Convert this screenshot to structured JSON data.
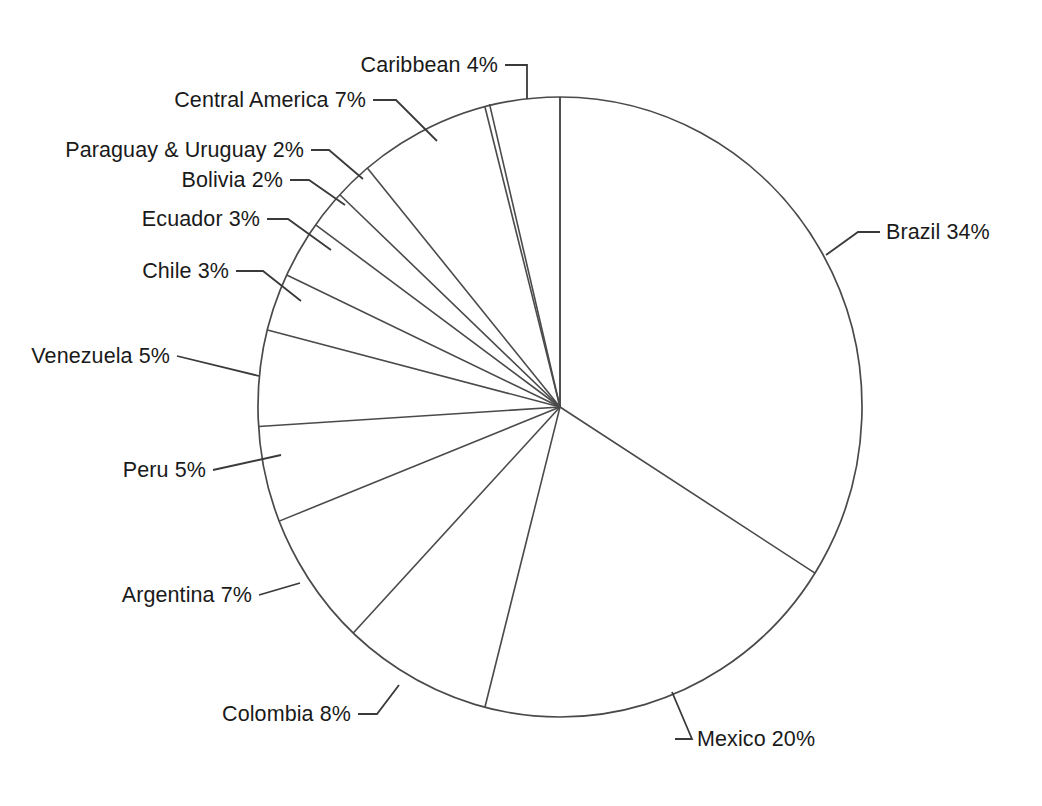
{
  "chart_data": {
    "type": "pie",
    "title": "",
    "subtitle": "",
    "xlabel": "",
    "ylabel": "",
    "legend_position": "none",
    "grid": false,
    "start_angle_deg": 0,
    "direction": "clockwise",
    "units": "percent",
    "total": 100,
    "categories": [
      "Brazil",
      "Mexico",
      "Colombia",
      "Argentina",
      "Peru",
      "Venezuela",
      "Chile",
      "Ecuador",
      "Bolivia",
      "Paraguay & Uruguay",
      "Central America",
      "Caribbean"
    ],
    "values": [
      34,
      20,
      8,
      7,
      5,
      5,
      3,
      3,
      2,
      2,
      7,
      4
    ],
    "slices": [
      {
        "label": "Brazil",
        "value": 34,
        "value_text": "34%",
        "label_text": "Brazil  34%"
      },
      {
        "label": "Mexico",
        "value": 20,
        "value_text": "20%",
        "label_text": "Mexico  20%"
      },
      {
        "label": "Colombia",
        "value": 8,
        "value_text": "8%",
        "label_text": "Colombia  8%"
      },
      {
        "label": "Argentina",
        "value": 7,
        "value_text": "7%",
        "label_text": "Argentina  7%"
      },
      {
        "label": "Peru",
        "value": 5,
        "value_text": "5%",
        "label_text": "Peru  5%"
      },
      {
        "label": "Venezuela",
        "value": 5,
        "value_text": "5%",
        "label_text": "Venezuela  5%"
      },
      {
        "label": "Chile",
        "value": 3,
        "value_text": "3%",
        "label_text": "Chile  3%"
      },
      {
        "label": "Ecuador",
        "value": 3,
        "value_text": "3%",
        "label_text": "Ecuador  3%"
      },
      {
        "label": "Bolivia",
        "value": 2,
        "value_text": "2%",
        "label_text": "Bolivia  2%"
      },
      {
        "label": "Paraguay & Uruguay",
        "value": 2,
        "value_text": "2%",
        "label_text": "Paraguay & Uruguay  2%"
      },
      {
        "label": "Central America",
        "value": 7,
        "value_text": "7%",
        "label_text": "Central America  7%"
      },
      {
        "label": "Caribbean",
        "value": 4,
        "value_text": "4%",
        "label_text": "Caribbean  4%"
      }
    ],
    "colors": {
      "background": "#ffffff",
      "stroke": "#4a4a4a",
      "text": "#1a1a1a",
      "leader": "#3a3a3a"
    }
  }
}
